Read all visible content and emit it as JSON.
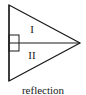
{
  "figure": {
    "caption": "reflection",
    "background_color": "#ffffff",
    "stroke_color": "#1a1a1a",
    "labels": [
      {
        "text": "I",
        "region": "upper",
        "x": 32,
        "y": 30
      },
      {
        "text": "II",
        "region": "lower",
        "x": 32,
        "y": 56
      }
    ],
    "shape": {
      "type": "triangle",
      "description": "right-pointing triangle bisected by a horizontal axis",
      "vertices": [
        {
          "name": "top-left",
          "x": 9,
          "y": 5
        },
        {
          "name": "bottom-left",
          "x": 9,
          "y": 81
        },
        {
          "name": "right-apex",
          "x": 80,
          "y": 43
        }
      ],
      "axis": {
        "name": "line-of-reflection",
        "x1": 9,
        "y1": 43,
        "x2": 80,
        "y2": 43
      },
      "right_angle_marker": {
        "x": 9,
        "y": 35,
        "width": 10,
        "height": 16
      }
    }
  }
}
